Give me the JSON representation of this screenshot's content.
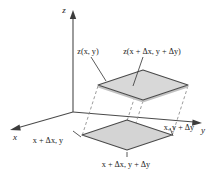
{
  "figure": {
    "type": "3d-surface-element-diagram",
    "background_color": "#ffffff",
    "line_color": "#3c3c3c",
    "fill_color": "#d8d8d8",
    "fill_color_base": "#d4d4d4",
    "text_color": "#1a1a1a"
  },
  "axes": {
    "z": {
      "label": "z",
      "name": "z-axis"
    },
    "x": {
      "label": "x",
      "name": "x-axis"
    },
    "y": {
      "label": "y",
      "name": "y-axis"
    }
  },
  "annotations": {
    "top_left": {
      "text": "z(x, y)",
      "parts": {
        "fn": "z",
        "open": "(",
        "var1": "x",
        "comma": ", ",
        "var2": "y",
        "close": ")"
      }
    },
    "top_right": {
      "text": "z(x + Δx, y + Δy)"
    },
    "bottom_left": {
      "text": "x + Δx, y"
    },
    "bottom_center": {
      "text": "x + Δx, y + Δy"
    },
    "right": {
      "text": "x, y + Δy"
    }
  },
  "geometry": {
    "origin": [
      73,
      112
    ],
    "top_plane": {
      "name": "surface-patch",
      "points": "98,85 143,70 188,85 143,100",
      "note": "tilted quadrilateral representing the surface element"
    },
    "base_plane": {
      "name": "base-projection",
      "points": "82,135 127,120 172,135 127,150",
      "note": "projection of the surface element onto the x-y plane"
    }
  }
}
